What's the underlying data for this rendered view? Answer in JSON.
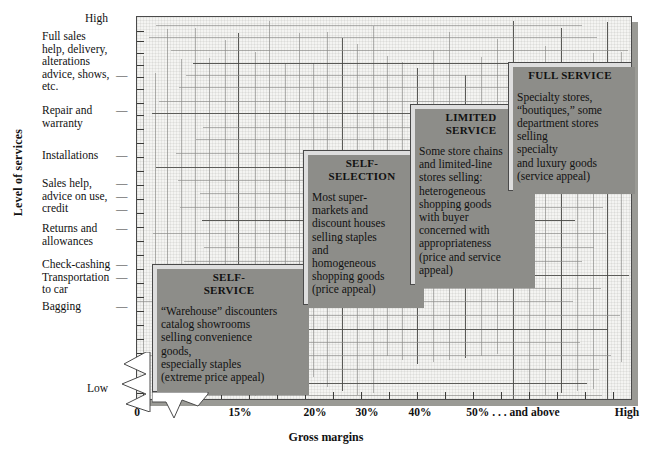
{
  "axes": {
    "y_title": "Level of services",
    "y_high": "High",
    "y_low": "Low",
    "x_title": "Gross margins",
    "y_ticks": [
      "Full sales\nhelp, delivery,\nalterations\nadvice, shows,\netc.",
      "Repair and\nwarranty",
      "Installations",
      "Sales help,\nadvice on use,\ncredit",
      "Returns and\nallowances",
      "Check-cashing\nTransportation\nto car",
      "Bagging"
    ],
    "x_ticks": [
      "0",
      "15%",
      "20%",
      "30%",
      "40%",
      "50% . . . and above",
      "High"
    ]
  },
  "boxes": [
    {
      "id": "self-service",
      "title": "SELF-\nSERVICE",
      "body": "“Warehouse” discounters\ncatalog showrooms\nselling convenience\ngoods,\nespecially staples\n(extreme price appeal)"
    },
    {
      "id": "self-selection",
      "title": "SELF-\nSELECTION",
      "body": "Most super-\nmarkets and\ndiscount houses\nselling staples\nand\nhomogeneous\nshopping goods\n(price appeal)"
    },
    {
      "id": "limited-service",
      "title": "LIMITED\nSERVICE",
      "body": "Some store chains\nand limited-line\nstores selling:\nheterogeneous\nshopping goods\nwith buyer\nconcerned with\nappropriateness\n(price and service\nappeal)"
    },
    {
      "id": "full-service",
      "title": "FULL SERVICE",
      "body": "Specialty stores,\n“boutiques,” some\ndepartment stores\nselling\nspecialty\nand luxury goods\n(service appeal)"
    }
  ],
  "chart_data": {
    "type": "scatter",
    "title": "",
    "xlabel": "Gross margins",
    "ylabel": "Level of services",
    "x_tick_labels": [
      "0",
      "15%",
      "20%",
      "30%",
      "40%",
      "50% . . . and above",
      "High"
    ],
    "y_tick_labels": [
      "Bagging",
      "Check-cashing / Transportation to car",
      "Returns and allowances",
      "Sales help, advice on use, credit",
      "Installations",
      "Repair and warranty",
      "Full sales help, delivery, alterations advice, shows, etc."
    ],
    "y_range_labels": [
      "Low",
      "High"
    ],
    "grid": true,
    "legend": "none",
    "points": [
      {
        "label": "SELF-SERVICE",
        "x": "0-15%",
        "y": "Bagging / low"
      },
      {
        "label": "SELF-SELECTION",
        "x": "15-20%",
        "y": "Returns and allowances"
      },
      {
        "label": "LIMITED SERVICE",
        "x": "30-40%",
        "y": "Installations / Repair and warranty"
      },
      {
        "label": "FULL SERVICE",
        "x": "50% and above",
        "y": "Full sales help, delivery, alterations"
      }
    ]
  }
}
